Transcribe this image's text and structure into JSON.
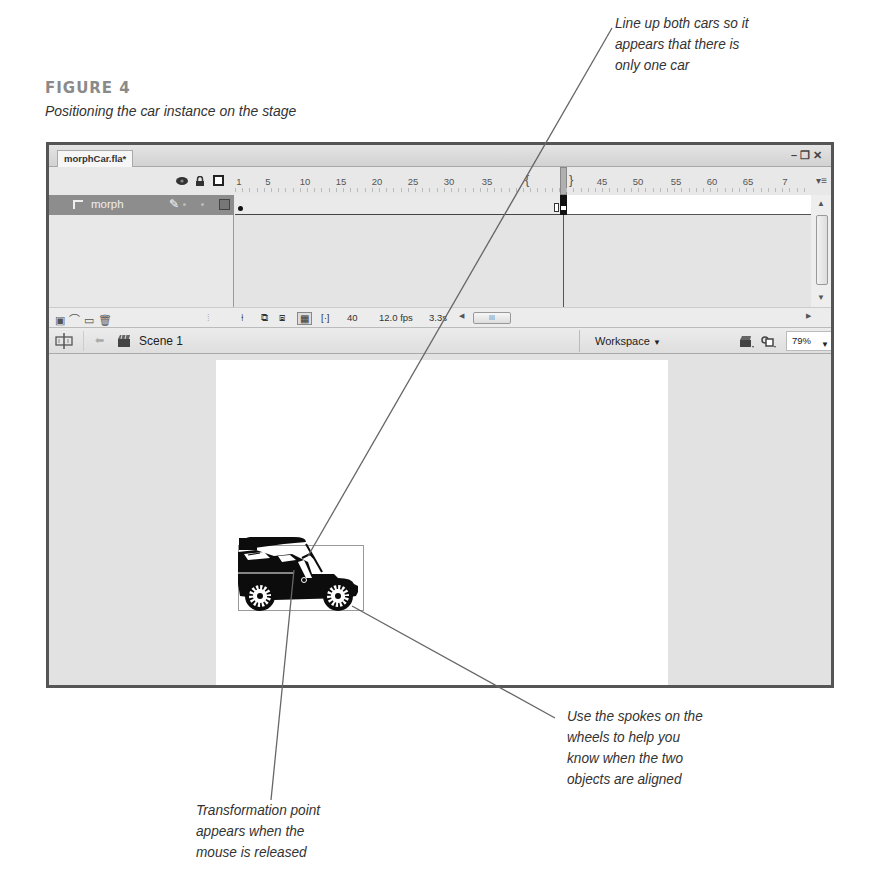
{
  "figure": {
    "label": "FIGURE 4",
    "caption": "Positioning the car instance on the stage"
  },
  "callouts": {
    "top_right": [
      "Line up both cars so it",
      "appears that there is",
      "only one car"
    ],
    "bottom_left": [
      "Transformation point",
      "appears when the",
      "mouse is released"
    ],
    "bottom_right": [
      "Use the spokes on the",
      "wheels to help you",
      "know when the two",
      "objects are aligned"
    ]
  },
  "window": {
    "tab_title": "morphCar.fla*",
    "controls": [
      "minimize",
      "restore",
      "close"
    ]
  },
  "timeline": {
    "header_icons": [
      "eye-icon",
      "lock-icon",
      "outline-icon"
    ],
    "ruler_labels": [
      "1",
      "5",
      "10",
      "15",
      "20",
      "25",
      "30",
      "35",
      "45",
      "50",
      "55",
      "60",
      "65",
      "7"
    ],
    "layers": [
      {
        "name": "morph",
        "selected": true
      }
    ],
    "current_frame": "40",
    "frame_rate": "12.0 fps",
    "elapsed": "3.3s",
    "hscroll_thumb": "III"
  },
  "editbar": {
    "scene": "Scene 1",
    "workspace": "Workspace",
    "zoom": "79%"
  },
  "colors": {
    "window_border": "#555555",
    "layer_selected": "#8d8d8d",
    "stage": "#ffffff",
    "pasteboard": "#e2e2e2"
  }
}
